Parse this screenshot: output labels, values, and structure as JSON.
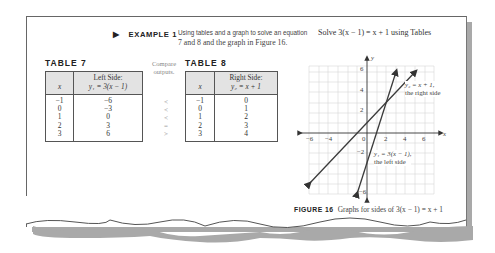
{
  "example": {
    "marker": "▶",
    "label": "EXAMPLE 1",
    "description_line1": "Using tables and a graph to solve an equation",
    "description_line2": "7 and 8 and the graph in Figure 16.",
    "problem": "Solve 3(x − 1) = x + 1 using Tables"
  },
  "compare_note": {
    "line1": "Compare",
    "line2": "outputs."
  },
  "table7": {
    "title": "TABLE 7",
    "headers": [
      "x",
      "Left Side:",
      "y₁ = 3(x − 1)"
    ],
    "rows": [
      [
        "−1",
        "−6"
      ],
      [
        "0",
        "−3"
      ],
      [
        "1",
        "0"
      ],
      [
        "2",
        "3"
      ],
      [
        "3",
        "6"
      ]
    ]
  },
  "comparisons": [
    "<",
    "<",
    "<",
    "=",
    ">"
  ],
  "table8": {
    "title": "TABLE 8",
    "headers": [
      "x",
      "Right Side:",
      "y₂ = x + 1"
    ],
    "rows": [
      [
        "−1",
        "0"
      ],
      [
        "0",
        "1"
      ],
      [
        "1",
        "2"
      ],
      [
        "2",
        "3"
      ],
      [
        "3",
        "4"
      ]
    ]
  },
  "figure": {
    "caption_label": "FIGURE 16",
    "caption_text": "Graphs for sides of 3(x − 1) = x + 1",
    "x_axis_label": "x",
    "y_axis_label": "y",
    "x_ticks": [
      "−6",
      "−4",
      "0",
      "2",
      "4",
      "6"
    ],
    "y_ticks": [
      "6",
      "4",
      "2",
      "−2",
      "−6"
    ],
    "line_right_label1": "y₂ = x + 1,",
    "line_right_label2": "the right side",
    "line_left_label1": "y₁ = 3(x − 1),",
    "line_left_label2": "the left side"
  },
  "colors": {
    "page_shadow": "#a9a9a9",
    "table_header_bg": "#e3e3e3",
    "line_color": "#3a3a3a",
    "grid_color": "#d8d8d8"
  }
}
